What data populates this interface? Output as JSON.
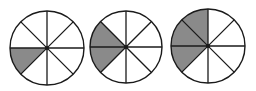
{
  "figure": {
    "stroke_color": "#1a1a1a",
    "fill_color": "#8a8a8a",
    "background": "#ffffff",
    "divisions": 8,
    "circles": [
      {
        "id": "circle-1",
        "cx": 47,
        "cy": 48,
        "r": 37,
        "shaded_parts": 1,
        "fraction": "1/8"
      },
      {
        "id": "circle-2",
        "cx": 126,
        "cy": 47,
        "r": 36,
        "shaded_parts": 2,
        "fraction": "2/8"
      },
      {
        "id": "circle-3",
        "cx": 208,
        "cy": 46,
        "r": 37,
        "shaded_parts": 3,
        "fraction": "3/8"
      }
    ]
  }
}
